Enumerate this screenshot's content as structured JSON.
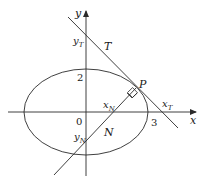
{
  "diagram": {
    "type": "ellipse-tangent-normal",
    "colors": {
      "stroke": "#2a2a2a",
      "text": "#1a1a1a",
      "background": "#ffffff"
    },
    "axes": {
      "x_label": "x",
      "y_label": "y",
      "origin_label": "0"
    },
    "ellipse": {
      "x_intercept_label": "3",
      "y_intercept_label": "2"
    },
    "tangent": {
      "label": "T",
      "x_intercept_label": "x",
      "x_intercept_sub": "T",
      "y_intercept_label": "y",
      "y_intercept_sub": "T"
    },
    "normal": {
      "label": "N",
      "x_intercept_label": "x",
      "x_intercept_sub": "N",
      "y_intercept_label": "y",
      "y_intercept_sub": "N"
    },
    "point": {
      "label": "P"
    }
  }
}
